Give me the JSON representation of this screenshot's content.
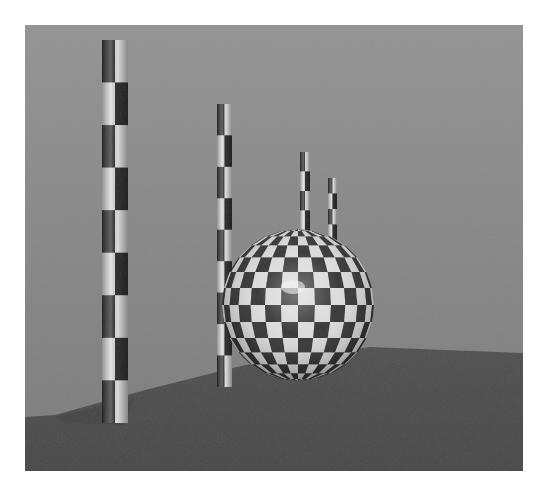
{
  "scene": {
    "description": "Rendered 3D scene: checkered sphere and four checkered cylindrical poles on a grey ground plane",
    "frame": {
      "x": 25,
      "y": 25,
      "width": 498,
      "height": 446
    },
    "colors": {
      "sky_top": "#929292",
      "sky_bottom": "#7c7c7c",
      "ground": "#4c4c4c",
      "ground_dark": "#444444",
      "shadow": "#3f3f3f",
      "check_light": "#dcdcdc",
      "check_dark": "#2a2a2a",
      "highlight": "#f4f4f4"
    },
    "ground_horizon": {
      "points": [
        [
          30,
          390
        ],
        [
          120,
          365
        ],
        [
          220,
          340
        ],
        [
          345,
          322
        ],
        [
          420,
          325
        ],
        [
          498,
          328
        ]
      ]
    },
    "poles": [
      {
        "name": "pole-1",
        "x": 77,
        "y": 15,
        "width": 26,
        "height": 383,
        "segments": 9
      },
      {
        "name": "pole-2",
        "x": 192,
        "y": 79,
        "width": 15,
        "height": 283,
        "segments": 9
      },
      {
        "name": "pole-3",
        "x": 275,
        "y": 127,
        "width": 10,
        "height": 78,
        "segments": 4
      },
      {
        "name": "pole-4",
        "x": 303,
        "y": 153,
        "width": 9,
        "height": 62,
        "segments": 4
      }
    ],
    "sphere": {
      "cx": 273,
      "cy": 280,
      "r": 76,
      "columns": 14,
      "rows": 14
    }
  }
}
